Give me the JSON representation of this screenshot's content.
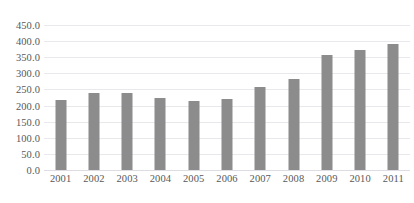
{
  "chart_data": {
    "type": "bar",
    "title": "",
    "subtitle": "",
    "xlabel": "",
    "ylabel": "",
    "categories": [
      "2001",
      "2002",
      "2003",
      "2004",
      "2005",
      "2006",
      "2007",
      "2008",
      "2009",
      "2010",
      "2011"
    ],
    "values": [
      218,
      240,
      240,
      224,
      214,
      221,
      257,
      281,
      358,
      372,
      392
    ],
    "series": [
      {
        "name": "",
        "values": [
          218,
          240,
          240,
          224,
          214,
          221,
          257,
          281,
          358,
          372,
          392
        ]
      }
    ],
    "ylim": [
      0,
      450
    ],
    "ytick_step": 50,
    "ytick_labels": [
      "0.0",
      "50.0",
      "100.0",
      "150.0",
      "200.0",
      "250.0",
      "300.0",
      "350.0",
      "400.0",
      "450.0"
    ],
    "ytick_values": [
      0,
      50,
      100,
      150,
      200,
      250,
      300,
      350,
      400,
      450
    ],
    "xtick_labels": [
      "2001",
      "2002",
      "2003",
      "2004",
      "2005",
      "2006",
      "2007",
      "2008",
      "2009",
      "2010",
      "2011"
    ],
    "grid": true,
    "grid_axis": "y",
    "legend": false,
    "legend_position": "none",
    "colors": {
      "bar": "#8c8c8c",
      "gridline": "#e9e9ed",
      "axis": "#dcdce2",
      "tick_label": "#585858",
      "background": "#ffffff"
    }
  }
}
